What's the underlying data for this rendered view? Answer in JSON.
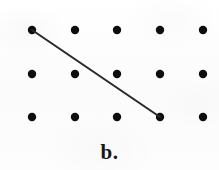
{
  "figure": {
    "label": "b.",
    "caption_label": "b.",
    "background_color": "#fcfcfc",
    "dot_color": "#0d0d0d",
    "line_color": "#2a2a2a"
  },
  "chart_data": {
    "type": "scatter",
    "title": "b.",
    "xlabel": "",
    "ylabel": "",
    "grid": false,
    "legend_position": "none",
    "rows": 3,
    "columns": 5,
    "dot_radius": 4.2,
    "xlim": [
      0,
      219
    ],
    "ylim": [
      0,
      170
    ],
    "x": [
      32,
      75,
      117,
      160,
      203,
      32,
      75,
      117,
      160,
      203,
      32,
      75,
      117,
      160,
      203
    ],
    "y": [
      30,
      30,
      30,
      30,
      30,
      74,
      74,
      74,
      74,
      74,
      117,
      117,
      117,
      117,
      117
    ],
    "point_labels": [
      "r1c1",
      "r1c2",
      "r1c3",
      "r1c4",
      "r1c5",
      "r2c1",
      "r2c2",
      "r2c3",
      "r2c4",
      "r2c5",
      "r3c1",
      "r3c2",
      "r3c3",
      "r3c4",
      "r3c5"
    ],
    "annotations": [
      {
        "type": "line-segment",
        "name": "diagonal-segment",
        "from_point": "r1c1",
        "to_point": "r3c4",
        "x1": 32,
        "y1": 30,
        "x2": 160,
        "y2": 117,
        "stroke_width": 2.1
      },
      {
        "type": "text",
        "name": "figure-label",
        "text": "b.",
        "x": 118,
        "y": 158
      }
    ]
  }
}
